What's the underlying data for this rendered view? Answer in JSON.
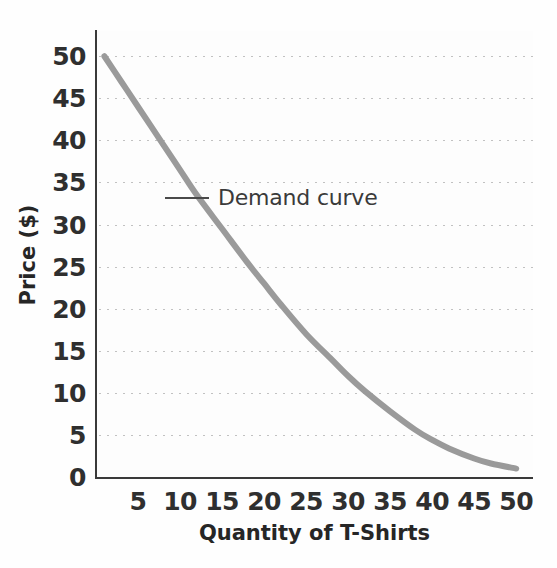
{
  "figure": {
    "top_cut_caption": "",
    "background_color": "#fefefe"
  },
  "annotation": {
    "label": "Demand curve",
    "leader_icon": "horizontal-line-icon"
  },
  "chart_data": {
    "type": "line",
    "title": "",
    "xlabel": "Quantity of T-Shirts",
    "ylabel": "Price ($)",
    "xlim": [
      0,
      52
    ],
    "ylim": [
      0,
      53
    ],
    "grid": "horizontal-dotted",
    "legend_position": "inline-annotation",
    "series": [
      {
        "name": "Demand curve",
        "color": "#9a9a9a",
        "line_width": 6,
        "x": [
          1,
          3,
          5,
          8,
          10,
          12,
          15,
          18,
          20,
          22,
          25,
          28,
          30,
          32,
          35,
          38,
          40,
          42,
          45,
          47,
          50
        ],
        "y": [
          50,
          47,
          44,
          39.5,
          36.5,
          33.5,
          29.5,
          25.5,
          23,
          20.5,
          17,
          14,
          12,
          10.2,
          7.8,
          5.6,
          4.4,
          3.4,
          2.2,
          1.6,
          1.0
        ]
      }
    ],
    "x_ticks": [
      5,
      10,
      15,
      20,
      25,
      30,
      35,
      40,
      45,
      50
    ],
    "x_tick_labels": [
      "5",
      "10",
      "15",
      "20",
      "25",
      "30",
      "35",
      "40",
      "45",
      "50"
    ],
    "y_ticks": [
      0,
      5,
      10,
      15,
      20,
      25,
      30,
      35,
      40,
      45,
      50
    ],
    "y_tick_labels": [
      "0",
      "5",
      "10",
      "15",
      "20",
      "25",
      "30",
      "35",
      "40",
      "45",
      "50"
    ],
    "axis_color": "#3a3a3a",
    "gridline_color": "#b6b6b6"
  }
}
